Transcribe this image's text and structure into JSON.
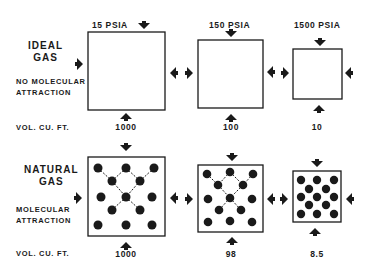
{
  "rows": [
    {
      "title_line1": "IDEAL",
      "title_line2": "GAS",
      "subtitle_line1": "NO MOLECULAR",
      "subtitle_line2": "ATTRACTION",
      "volume_label": "VOL. CU. FT.",
      "molecules": false
    },
    {
      "title_line1": "NATURAL",
      "title_line2": "GAS",
      "subtitle_line1": "MOLECULAR",
      "subtitle_line2": "ATTRACTION",
      "volume_label": "VOL. CU. FT.",
      "molecules": true
    }
  ],
  "pressures": [
    "15  PSIA",
    "150  PSIA",
    "1500  PSIA"
  ],
  "ideal_volumes": [
    "1000",
    "100",
    "10"
  ],
  "natural_volumes": [
    "1000",
    "98",
    "8.5"
  ],
  "colors": {
    "ink": "#1a1a1a",
    "background": "#ffffff"
  }
}
